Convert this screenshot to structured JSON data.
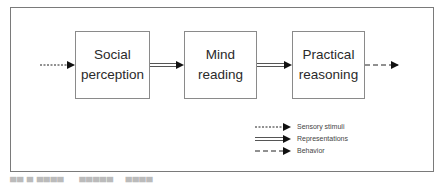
{
  "diagram": {
    "nodes": [
      {
        "id": "social-perception",
        "line1": "Social",
        "line2": "perception"
      },
      {
        "id": "mind-reading",
        "line1": "Mind",
        "line2": "reading"
      },
      {
        "id": "practical-reasoning",
        "line1": "Practical",
        "line2": "reasoning"
      }
    ],
    "edges": [
      {
        "from": "input",
        "to": "social-perception",
        "type": "sensory-stimuli"
      },
      {
        "from": "social-perception",
        "to": "mind-reading",
        "type": "representations"
      },
      {
        "from": "mind-reading",
        "to": "practical-reasoning",
        "type": "representations"
      },
      {
        "from": "practical-reasoning",
        "to": "output",
        "type": "behavior"
      }
    ],
    "legend": [
      {
        "style": "short-dash",
        "label": "Sensory stimuli"
      },
      {
        "style": "double-line",
        "label": "Representations"
      },
      {
        "style": "long-dash",
        "label": "Behavior"
      }
    ],
    "colors": {
      "line": "#222222",
      "border": "#7a7a7a"
    }
  }
}
